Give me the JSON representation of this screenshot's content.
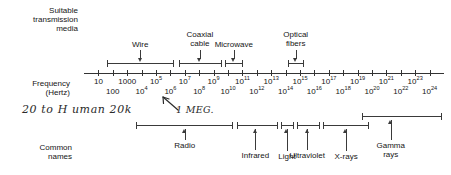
{
  "figure": {
    "row_titles": {
      "media": [
        "Suitable",
        "transmission",
        "media"
      ],
      "axis": [
        "Frequency",
        "(Hertz)"
      ],
      "names": [
        "Common",
        "names"
      ]
    }
  },
  "chart_data": {
    "type": "diagram",
    "xlabel": "Frequency (Hertz)",
    "scale": "log10",
    "xlim": [
      0,
      25
    ],
    "axis_ticks_upper_row": [
      {
        "label": "10",
        "exp": "",
        "decade": 1
      },
      {
        "label": "1000",
        "exp": "",
        "decade": 3
      },
      {
        "label": "10",
        "exp": "5",
        "decade": 5
      },
      {
        "label": "10",
        "exp": "7",
        "decade": 7
      },
      {
        "label": "10",
        "exp": "9",
        "decade": 9
      },
      {
        "label": "10",
        "exp": "11",
        "decade": 11
      },
      {
        "label": "10",
        "exp": "13",
        "decade": 13
      },
      {
        "label": "10",
        "exp": "15",
        "decade": 15
      },
      {
        "label": "10",
        "exp": "17",
        "decade": 17
      },
      {
        "label": "10",
        "exp": "19",
        "decade": 19
      },
      {
        "label": "10",
        "exp": "21",
        "decade": 21
      },
      {
        "label": "10",
        "exp": "23",
        "decade": 23
      }
    ],
    "axis_ticks_lower_row": [
      {
        "label": "100",
        "exp": "",
        "decade": 2
      },
      {
        "label": "10",
        "exp": "4",
        "decade": 4
      },
      {
        "label": "10",
        "exp": "6",
        "decade": 6
      },
      {
        "label": "10",
        "exp": "8",
        "decade": 8
      },
      {
        "label": "10",
        "exp": "10",
        "decade": 10
      },
      {
        "label": "10",
        "exp": "12",
        "decade": 12
      },
      {
        "label": "10",
        "exp": "14",
        "decade": 14
      },
      {
        "label": "10",
        "exp": "16",
        "decade": 16
      },
      {
        "label": "10",
        "exp": "18",
        "decade": 18
      },
      {
        "label": "10",
        "exp": "20",
        "decade": 20
      },
      {
        "label": "10",
        "exp": "22",
        "decade": 22
      },
      {
        "label": "10",
        "exp": "24",
        "decade": 24
      }
    ],
    "media_bands": [
      {
        "name": "Wire",
        "label_lines": [
          "Wire"
        ],
        "start_decade": 1.6,
        "end_decade": 6.2
      },
      {
        "name": "Coaxial cable",
        "label_lines": [
          "Coaxial",
          "cable"
        ],
        "start_decade": 6.6,
        "end_decade": 9.5
      },
      {
        "name": "Microwave",
        "label_lines": [
          "Microwave"
        ],
        "start_decade": 9.8,
        "end_decade": 11.0
      },
      {
        "name": "Optical fibers",
        "label_lines": [
          "Optical",
          "fibers"
        ],
        "start_decade": 14.2,
        "end_decade": 15.2
      }
    ],
    "name_bands": [
      {
        "name": "Radio",
        "label_lines": [
          "Radio"
        ],
        "start_decade": 3.6,
        "end_decade": 10.3,
        "arrow_decade": 7.0,
        "level": 0
      },
      {
        "name": "Infrared",
        "label_lines": [
          "Infrared"
        ],
        "start_decade": 10.6,
        "end_decade": 13.4,
        "arrow_decade": 11.9,
        "level": 0
      },
      {
        "name": "Light",
        "label_lines": [
          "Light"
        ],
        "start_decade": 13.7,
        "end_decade": 14.5,
        "arrow_decade": 14.1,
        "level": 0
      },
      {
        "name": "Ultraviolet",
        "label_lines": [
          "Ultraviolet"
        ],
        "start_decade": 14.8,
        "end_decade": 16.3,
        "arrow_decade": 15.5,
        "level": 0
      },
      {
        "name": "X-rays",
        "label_lines": [
          "X-rays"
        ],
        "start_decade": 16.6,
        "end_decade": 19.7,
        "arrow_decade": 18.2,
        "level": 0
      },
      {
        "name": "Gamma rays",
        "label_lines": [
          "Gamma",
          "rays"
        ],
        "start_decade": 19.3,
        "end_decade": 24.8,
        "arrow_decade": 21.3,
        "level": 1
      }
    ],
    "annotations": [
      {
        "id": "audio-range",
        "text": "20 to H uman 20k",
        "kind": "handwritten"
      },
      {
        "id": "one-megahertz",
        "text": "1 MEG.",
        "kind": "handwritten",
        "points_to_decade": 6.0
      }
    ]
  }
}
